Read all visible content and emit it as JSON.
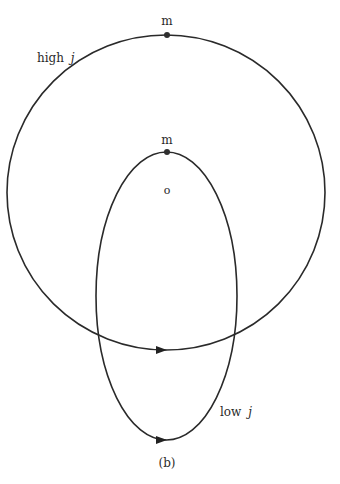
{
  "figure": {
    "caption": "(b)",
    "colors": {
      "stroke": "#2a2a2a",
      "background": "#ffffff"
    },
    "orbits": [
      {
        "name": "high-j-orbit",
        "label_main": "high",
        "label_var": "j",
        "shape": "near-circle",
        "center": [
          166,
          192
        ],
        "radii": [
          159,
          158
        ],
        "direction_arrow_at": [
          163,
          350
        ]
      },
      {
        "name": "low-j-orbit",
        "label_main": "low",
        "label_var": "j",
        "shape": "elongated-ellipse",
        "center": [
          166.5,
          296
        ],
        "radii": [
          71,
          144
        ],
        "direction_arrow_at": [
          163,
          440
        ]
      }
    ],
    "points": [
      {
        "name": "apocenter-high-j",
        "label": "m",
        "position": [
          167,
          35
        ]
      },
      {
        "name": "apocenter-low-j",
        "label": "m",
        "position": [
          167,
          152
        ]
      },
      {
        "name": "center-origin",
        "label": "o",
        "position": [
          167,
          190
        ]
      }
    ]
  }
}
